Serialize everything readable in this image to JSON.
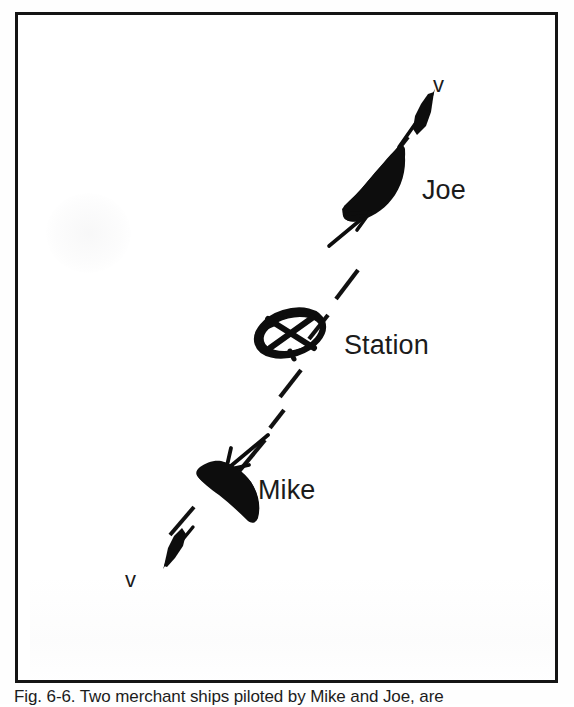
{
  "figure": {
    "frame": {
      "border_color": "#141414",
      "background_color": "#ffffff"
    },
    "ink_color": "#0d0d0d",
    "labels": {
      "joe": "Joe",
      "station": "Station",
      "mike": "Mike",
      "velocity_top": "v",
      "velocity_bottom": "v"
    },
    "caption": "Fig. 6-6. Two merchant ships piloted by Mike and Joe, are",
    "elements": [
      {
        "name": "ship-joe",
        "label": "Joe",
        "kind": "ship",
        "heading": "up-right",
        "position": {
          "x": 372,
          "y": 175
        }
      },
      {
        "name": "velocity-vector-joe",
        "label": "v",
        "kind": "velocity-arrow",
        "direction": "up-right",
        "position": {
          "x": 400,
          "y": 105
        }
      },
      {
        "name": "force-arrow-joe",
        "kind": "force-arrow",
        "direction": "up-right",
        "position": {
          "x": 338,
          "y": 215
        }
      },
      {
        "name": "station-marker",
        "label": "Station",
        "kind": "circle-cross-marker",
        "position": {
          "x": 287,
          "y": 330
        }
      },
      {
        "name": "ship-mike",
        "label": "Mike",
        "kind": "ship",
        "heading": "down-left",
        "position": {
          "x": 207,
          "y": 475
        }
      },
      {
        "name": "velocity-vector-mike",
        "label": "v",
        "kind": "velocity-arrow",
        "direction": "down-left",
        "position": {
          "x": 158,
          "y": 530
        }
      },
      {
        "name": "force-arrow-mike",
        "kind": "force-arrow",
        "direction": "down-left",
        "position": {
          "x": 230,
          "y": 430
        }
      },
      {
        "name": "dashed-path-line",
        "kind": "dashed-line",
        "description": "dashed track running lower-left to upper-right through the station"
      }
    ]
  }
}
